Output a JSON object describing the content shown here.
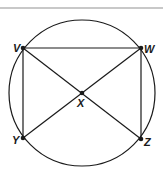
{
  "diagram": {
    "circle": {
      "cx": 82,
      "cy": 93,
      "r": 73
    },
    "points": [
      {
        "id": "V",
        "label": "V",
        "x": 23,
        "y": 48
      },
      {
        "id": "W",
        "label": "W",
        "x": 141,
        "y": 48
      },
      {
        "id": "X",
        "label": "X",
        "x": 82,
        "y": 93
      },
      {
        "id": "Y",
        "label": "Y",
        "x": 23,
        "y": 138
      },
      {
        "id": "Z",
        "label": "Z",
        "x": 141,
        "y": 139
      }
    ],
    "segments": [
      [
        "V",
        "W"
      ],
      [
        "V",
        "Y"
      ],
      [
        "W",
        "Z"
      ],
      [
        "V",
        "Z"
      ],
      [
        "W",
        "Y"
      ]
    ],
    "colors": {
      "stroke": "#1a1a1a",
      "divider": "#c8c8c8"
    }
  }
}
